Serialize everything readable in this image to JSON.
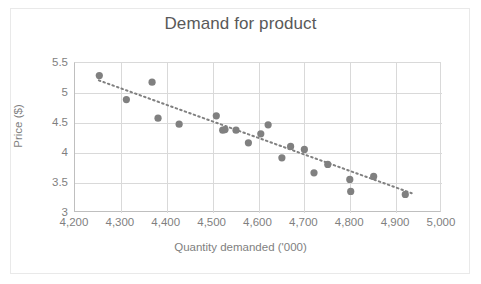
{
  "chart_data": {
    "type": "scatter",
    "title": "Demand for product",
    "xlabel": "Quantity demanded ('000)",
    "ylabel": "Price ($)",
    "xlim": [
      4200,
      5000
    ],
    "ylim": [
      3,
      5.5
    ],
    "grid": true,
    "legend": "none",
    "xticks": [
      "4,200",
      "4,300",
      "4,400",
      "4,500",
      "4,600",
      "4,700",
      "4,800",
      "4,900",
      "5,000"
    ],
    "xtick_values": [
      4200,
      4300,
      4400,
      4500,
      4600,
      4700,
      4800,
      4900,
      5000
    ],
    "yticks": [
      "3",
      "3.5",
      "4",
      "4.5",
      "5",
      "5.5"
    ],
    "ytick_values": [
      3,
      3.5,
      4,
      4.5,
      5,
      5.5
    ],
    "marker_color": "#808080",
    "trendline_color": "#808080",
    "trendline_style": "dotted",
    "points": [
      {
        "x": 4253,
        "y": 5.29
      },
      {
        "x": 4312,
        "y": 4.89
      },
      {
        "x": 4368,
        "y": 5.18
      },
      {
        "x": 4381,
        "y": 4.58
      },
      {
        "x": 4427,
        "y": 4.48
      },
      {
        "x": 4508,
        "y": 4.62
      },
      {
        "x": 4522,
        "y": 4.38
      },
      {
        "x": 4527,
        "y": 4.39
      },
      {
        "x": 4551,
        "y": 4.38
      },
      {
        "x": 4578,
        "y": 4.17
      },
      {
        "x": 4605,
        "y": 4.32
      },
      {
        "x": 4621,
        "y": 4.47
      },
      {
        "x": 4651,
        "y": 3.92
      },
      {
        "x": 4670,
        "y": 4.11
      },
      {
        "x": 4700,
        "y": 4.06
      },
      {
        "x": 4721,
        "y": 3.67
      },
      {
        "x": 4751,
        "y": 3.81
      },
      {
        "x": 4799,
        "y": 3.56
      },
      {
        "x": 4801,
        "y": 3.36
      },
      {
        "x": 4851,
        "y": 3.61
      },
      {
        "x": 4920,
        "y": 3.31
      }
    ],
    "trendline": {
      "x_start": 4252,
      "y_start": 5.21,
      "x_end": 4934,
      "y_end": 3.33
    }
  }
}
